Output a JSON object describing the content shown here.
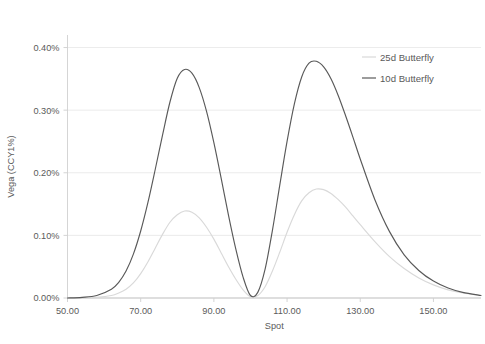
{
  "chart_data": {
    "type": "line",
    "title": "",
    "xlabel": "Spot",
    "ylabel": "Vega (CCY1%)",
    "xlim": [
      50,
      163
    ],
    "ylim": [
      0,
      0.0042
    ],
    "xticks": [
      50,
      70,
      90,
      110,
      130,
      150
    ],
    "xtick_labels": [
      "50.00",
      "70.00",
      "90.00",
      "110.00",
      "130.00",
      "150.00"
    ],
    "yticks": [
      0,
      0.001,
      0.002,
      0.003,
      0.004
    ],
    "ytick_labels": [
      "0.00%",
      "0.10%",
      "0.20%",
      "0.30%",
      "0.40%"
    ],
    "grid": "horizontal",
    "legend_position": "top-right",
    "series": [
      {
        "name": "25d Butterfly",
        "color": "#d9d9d9",
        "x": [
          50,
          54,
          58,
          62,
          64,
          66,
          68,
          70,
          72,
          74,
          76,
          78,
          80,
          82,
          84,
          86,
          88,
          90,
          92,
          94,
          96,
          98,
          100,
          102,
          104,
          106,
          108,
          110,
          112,
          114,
          116,
          118,
          120,
          122,
          124,
          126,
          128,
          130,
          134,
          138,
          142,
          146,
          150,
          154,
          158,
          163
        ],
        "y": [
          0.0,
          0.0,
          1e-05,
          4e-05,
          8e-05,
          0.00014,
          0.00024,
          0.00039,
          0.00058,
          0.0008,
          0.00102,
          0.00121,
          0.00133,
          0.00139,
          0.00137,
          0.00128,
          0.00113,
          0.00094,
          0.00072,
          0.0005,
          0.0003,
          0.00013,
          2e-05,
          4e-05,
          0.00018,
          0.00043,
          0.00073,
          0.00105,
          0.00133,
          0.00155,
          0.00168,
          0.00174,
          0.00173,
          0.00167,
          0.00157,
          0.00145,
          0.00131,
          0.00117,
          0.0009,
          0.00066,
          0.00047,
          0.00032,
          0.00021,
          0.00013,
          8e-05,
          4e-05
        ]
      },
      {
        "name": "10d Butterfly",
        "color": "#595959",
        "x": [
          50,
          54,
          58,
          62,
          64,
          66,
          68,
          70,
          72,
          74,
          76,
          78,
          80,
          82,
          84,
          86,
          88,
          90,
          92,
          94,
          96,
          98,
          100,
          102,
          104,
          106,
          108,
          110,
          112,
          114,
          116,
          118,
          120,
          122,
          124,
          126,
          128,
          130,
          134,
          138,
          142,
          146,
          150,
          154,
          158,
          163
        ],
        "y": [
          0.0,
          1e-05,
          4e-05,
          0.00014,
          0.00025,
          0.00043,
          0.0007,
          0.00107,
          0.00153,
          0.00206,
          0.00261,
          0.00313,
          0.00351,
          0.00365,
          0.00359,
          0.00336,
          0.00298,
          0.00248,
          0.00191,
          0.00132,
          0.00078,
          0.00033,
          4e-05,
          9e-05,
          0.00046,
          0.00108,
          0.0018,
          0.0025,
          0.0031,
          0.00353,
          0.00375,
          0.00378,
          0.00369,
          0.0035,
          0.00323,
          0.00291,
          0.00257,
          0.00222,
          0.00157,
          0.00106,
          0.00069,
          0.00044,
          0.00027,
          0.00016,
          9e-05,
          4e-05
        ]
      }
    ]
  },
  "legend": {
    "items": [
      {
        "label": "25d Butterfly"
      },
      {
        "label": "10d Butterfly"
      }
    ]
  },
  "caption": {
    "text": ""
  }
}
